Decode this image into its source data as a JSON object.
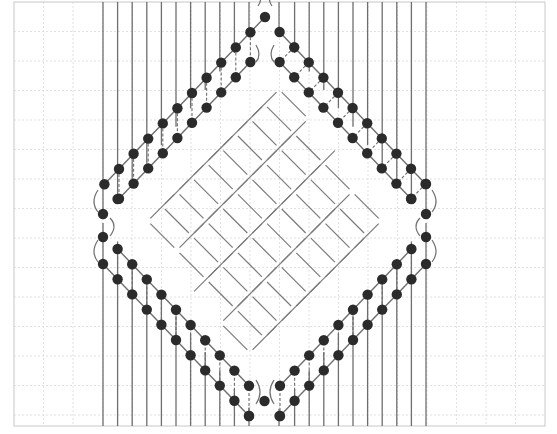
{
  "diagram": {
    "type": "macrame-diamond-pattern",
    "colors": {
      "background": "#ffffff",
      "grid": "#d9d9d9",
      "frame": "#c8c8c8",
      "thread": "#6e6e6e",
      "weave": "#7a7a7a",
      "bead": "#2b2b2b"
    },
    "frame": {
      "x": 14,
      "y": 2,
      "width": 531,
      "height": 424
    },
    "grid": {
      "spacing": 29.5
    },
    "threads": {
      "left_x": [
        103,
        117.6,
        132.2,
        146.8,
        161.4,
        176,
        190.6,
        205.2,
        219.8,
        234.4,
        249
      ],
      "right_x": [
        279,
        294.6,
        309.2,
        323.8,
        338.4,
        353,
        367.6,
        382.2,
        396.8,
        411.4,
        426
      ],
      "top_y": 2,
      "bottom_y": 426
    },
    "diamond": {
      "top": [
        265,
        17
      ],
      "left": [
        103,
        225
      ],
      "right": [
        426,
        225
      ],
      "bottom": [
        264,
        426
      ],
      "step": 14.6
    }
  }
}
